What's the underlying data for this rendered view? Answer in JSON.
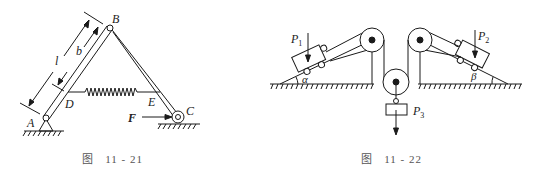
{
  "figures": [
    {
      "caption_prefix": "图",
      "caption_number": "11 - 21",
      "labels": {
        "A": "A",
        "B": "B",
        "C": "C",
        "D": "D",
        "E": "E",
        "F": "F",
        "l": "l",
        "b": "b"
      },
      "description": "Two hinged bars AB and BC forming an A-frame, pinned at A, roller at C, spring between D and E, horizontal force F at C"
    },
    {
      "caption_prefix": "图",
      "caption_number": "11 - 22",
      "labels": {
        "P1": "P",
        "P1_sub": "1",
        "P2": "P",
        "P2_sub": "2",
        "P3": "P",
        "P3_sub": "3",
        "alpha": "α",
        "beta": "β"
      },
      "description": "Two carts on inclines of angles α and β connected by a rope over two fixed pulleys and one movable pulley carrying weight P3"
    }
  ],
  "colors": {
    "ink": "#1a1a1a",
    "caption": "#555555",
    "background": "#ffffff"
  }
}
